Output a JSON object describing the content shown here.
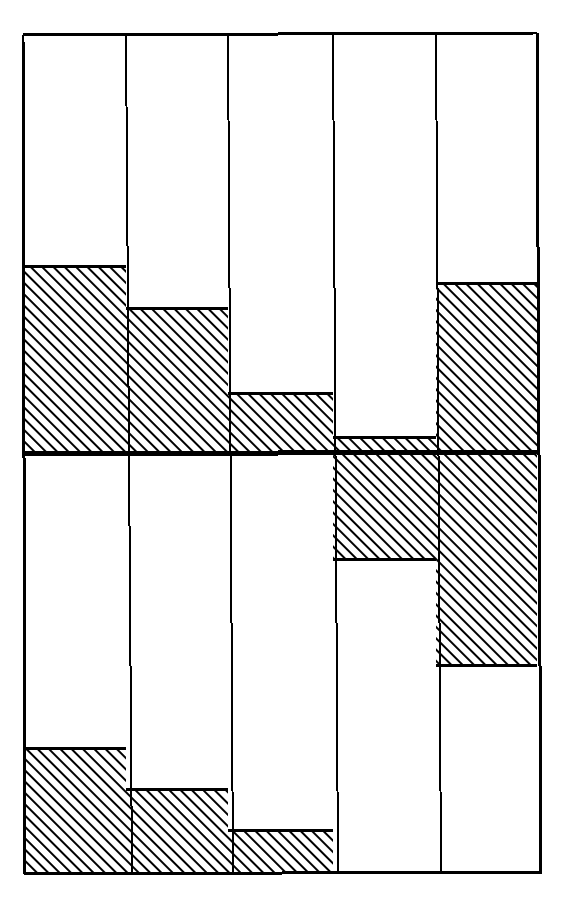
{
  "figure": {
    "title": "Two-register hatched bar diagram",
    "background_color": "#ffffff",
    "ink_color": "#000000",
    "hatch_color": "#000000"
  },
  "geometry": {
    "canvas_width": 570,
    "canvas_height": 917,
    "frame": {
      "left": 23,
      "right": 537,
      "top": 35,
      "bottom": 874
    },
    "midline_y": 454,
    "midline_thickness": 5,
    "frame_thickness": 3,
    "column_thickness": 2,
    "column_edges": [
      23,
      126,
      228,
      333,
      436,
      537
    ],
    "hatch_spacing": 8,
    "hatch_stroke": 3,
    "hatch_angle_deg": 45
  },
  "chart_data": {
    "type": "bar",
    "title": "Two-register hatched bar diagram",
    "subtitle": "",
    "xlabel": "",
    "ylabel": "",
    "grid": false,
    "legend_position": "none",
    "orientation": "vertical",
    "categories": [
      "1",
      "2",
      "3",
      "4",
      "5"
    ],
    "registers": [
      {
        "name": "upper",
        "baseline_y": 454,
        "ceiling_y": 35,
        "direction": "bars grow upward from the midline",
        "axis_span_px": 419,
        "bars": [
          {
            "category": "1",
            "hatch_top_y": 266,
            "hatch_bottom_y": 454,
            "height_px": 188,
            "fraction": 0.449
          },
          {
            "category": "2",
            "hatch_top_y": 308,
            "hatch_bottom_y": 454,
            "height_px": 146,
            "fraction": 0.348
          },
          {
            "category": "3",
            "hatch_top_y": 393,
            "hatch_bottom_y": 454,
            "height_px": 61,
            "fraction": 0.146
          },
          {
            "category": "4",
            "hatch_top_y": 437,
            "hatch_bottom_y": 454,
            "height_px": 17,
            "fraction": 0.041
          },
          {
            "category": "5",
            "hatch_top_y": 283,
            "hatch_bottom_y": 454,
            "height_px": 171,
            "fraction": 0.408
          }
        ]
      },
      {
        "name": "lower",
        "baseline_y": 874,
        "ceiling_y": 454,
        "direction": "mixed: columns 1-3 grow upward from the bottom edge, columns 4-5 hang downward from the midline",
        "axis_span_px": 420,
        "bars": [
          {
            "category": "1",
            "hatch_top_y": 748,
            "hatch_bottom_y": 874,
            "height_px": 126,
            "fraction": 0.3,
            "anchor": "bottom"
          },
          {
            "category": "2",
            "hatch_top_y": 789,
            "hatch_bottom_y": 874,
            "height_px": 85,
            "fraction": 0.202,
            "anchor": "bottom"
          },
          {
            "category": "3",
            "hatch_top_y": 830,
            "hatch_bottom_y": 874,
            "height_px": 44,
            "fraction": 0.105,
            "anchor": "bottom"
          },
          {
            "category": "4",
            "hatch_top_y": 454,
            "hatch_bottom_y": 559,
            "height_px": 105,
            "fraction": 0.25,
            "anchor": "top"
          },
          {
            "category": "5",
            "hatch_top_y": 454,
            "hatch_bottom_y": 665,
            "height_px": 211,
            "fraction": 0.502,
            "anchor": "top"
          }
        ]
      }
    ],
    "series": [
      {
        "name": "upper register",
        "values": [
          0.449,
          0.348,
          0.146,
          0.041,
          0.408
        ]
      },
      {
        "name": "lower register",
        "values": [
          0.3,
          0.202,
          0.105,
          0.25,
          0.502
        ]
      }
    ],
    "ylim": [
      0,
      1
    ],
    "annotations": []
  }
}
